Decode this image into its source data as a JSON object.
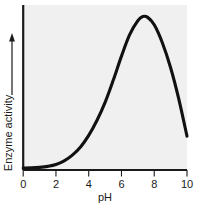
{
  "chart_data": {
    "type": "line",
    "title": "",
    "xlabel": "pH",
    "ylabel": "Enzyme activity",
    "ylabel_arrow": "↑",
    "xlim": [
      0,
      10
    ],
    "ylim": [
      0,
      1
    ],
    "xticks": [
      0,
      2,
      4,
      6,
      8,
      10
    ],
    "xticklabels": [
      "0",
      "2",
      "4",
      "6",
      "8",
      "10"
    ],
    "yticks": [],
    "yticklabels": [],
    "grid": false,
    "legend": false,
    "series": [
      {
        "name": "Enzyme activity vs pH",
        "color": "#111111",
        "x": [
          0.0,
          0.5,
          1.0,
          1.5,
          2.0,
          2.5,
          3.0,
          3.5,
          4.0,
          4.5,
          5.0,
          5.5,
          6.0,
          6.5,
          7.0,
          7.3,
          7.6,
          8.0,
          8.5,
          9.0,
          9.5,
          10.0
        ],
        "y": [
          0.012,
          0.013,
          0.016,
          0.022,
          0.033,
          0.055,
          0.09,
          0.14,
          0.21,
          0.3,
          0.41,
          0.545,
          0.69,
          0.82,
          0.905,
          0.93,
          0.925,
          0.88,
          0.77,
          0.62,
          0.43,
          0.205
        ]
      }
    ],
    "annotations": {
      "peak_ph": 7.3,
      "peak_description": "Optimum pH"
    }
  },
  "plot": {
    "background_color": "#f0f0f0",
    "axis_color": "#1a1a1a",
    "curve_color": "#111111"
  }
}
